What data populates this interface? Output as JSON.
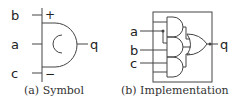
{
  "symbol": {
    "inputs": [
      {
        "name": "b",
        "polarity": "+"
      },
      {
        "name": "a"
      },
      {
        "name": "c",
        "polarity": "−"
      }
    ],
    "output": "q",
    "caption": "(a) Symbol"
  },
  "implementation": {
    "inputs": [
      "a",
      "b",
      "c"
    ],
    "output": "q",
    "gates": [
      "AND",
      "AND",
      "AND",
      "OR"
    ],
    "caption": "(b) Implementation"
  }
}
